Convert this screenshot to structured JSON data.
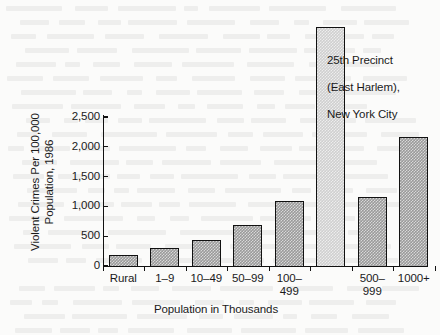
{
  "chart_data": {
    "type": "bar",
    "title": "",
    "xlabel": "Population in Thousands",
    "ylabel": "Violent Crimes Per 100,000\nPopulation, 1986",
    "ylabel_line1": "Violent Crimes Per 100,000",
    "ylabel_line2": "Population, 1986",
    "categories": [
      "Rural",
      "1–9",
      "10–49",
      "50–99",
      "100–\n499",
      "500–\n999",
      "1000+"
    ],
    "category_lines": [
      [
        "Rural"
      ],
      [
        "1–9"
      ],
      [
        "10–49"
      ],
      [
        "50–99"
      ],
      [
        "100–",
        "499"
      ],
      [
        "500–",
        "999"
      ],
      [
        "1000+"
      ]
    ],
    "values": [
      185,
      300,
      425,
      675,
      1090,
      1155,
      2155
    ],
    "highlight_bar": {
      "label": "25th Precinct (East Harlem), New York City",
      "value": 4000,
      "position_after_category": "100–499",
      "color": "#cfcfcf"
    },
    "bar_color": "#9a9a9a",
    "bar_border_color": "#111111",
    "ylim": [
      0,
      2500
    ],
    "yticks": [
      0,
      500,
      1000,
      1500,
      2000,
      2500
    ],
    "ytick_labels": [
      "0",
      "500",
      "1,000",
      "1,500",
      "2,000",
      "2,500"
    ],
    "grid": false,
    "legend": null,
    "annotations": [
      {
        "text": "25th Precinct\n(East Harlem),\nNew York City",
        "lines": [
          "25th Precinct",
          "(East Harlem),",
          "New York City"
        ]
      }
    ]
  },
  "annotation": {
    "line1": "25th Precinct",
    "line2": "(East Harlem),",
    "line3": "New York City"
  },
  "axes": {
    "y_title_line1": "Violent Crimes Per 100,000",
    "y_title_line2": "Population, 1986",
    "x_title": "Population in Thousands",
    "ytick_labels": [
      "2,500",
      "2,000",
      "1,500",
      "1,000",
      "500",
      "0"
    ],
    "xtick_labels": [
      {
        "line1": "Rural",
        "line2": ""
      },
      {
        "line1": "1–9",
        "line2": ""
      },
      {
        "line1": "10–49",
        "line2": ""
      },
      {
        "line1": "50–99",
        "line2": ""
      },
      {
        "line1": "100–",
        "line2": "499"
      },
      {
        "line1": "500–",
        "line2": "999"
      },
      {
        "line1": "1000+",
        "line2": ""
      }
    ]
  }
}
